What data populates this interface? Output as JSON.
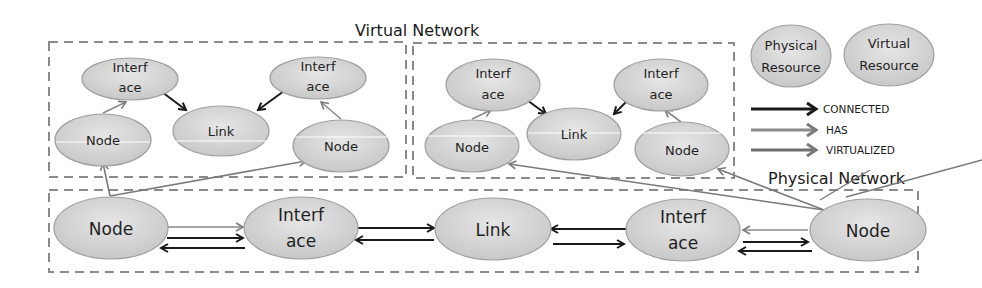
{
  "titles": {
    "virtual_network": "Virtual Network",
    "physical_network": "Physical Network"
  },
  "legend": {
    "physical_resource": [
      "Physical",
      "Resource"
    ],
    "virtual_resource": [
      "Virtual",
      "Resource"
    ],
    "connected": "CONNECTED",
    "has": "HAS",
    "virtualized": "VIRTUALIZED"
  },
  "virtual_network_1": {
    "interface_left": [
      "Interf",
      "ace"
    ],
    "interface_right": [
      "Interf",
      "ace"
    ],
    "link": "Link",
    "node_left": "Node",
    "node_right": "Node"
  },
  "virtual_network_2": {
    "interface_left": [
      "Interf",
      "ace"
    ],
    "interface_right": [
      "Interf",
      "ace"
    ],
    "link": "Link",
    "node_left": "Node",
    "node_right": "Node"
  },
  "physical_network": {
    "node_left": "Node",
    "interface_left": [
      "Interf",
      "ace"
    ],
    "link": "Link",
    "interface_right": [
      "Interf",
      "ace"
    ],
    "node_right": "Node"
  },
  "colors": {
    "ellipse_fill": "#d4d4d4",
    "ellipse_stroke": "#9a9a9a",
    "connected": "#1a1a1a",
    "has": "#8a8a8a",
    "virtualized": "#6e6e6e",
    "dash": "#8a8a8a"
  }
}
